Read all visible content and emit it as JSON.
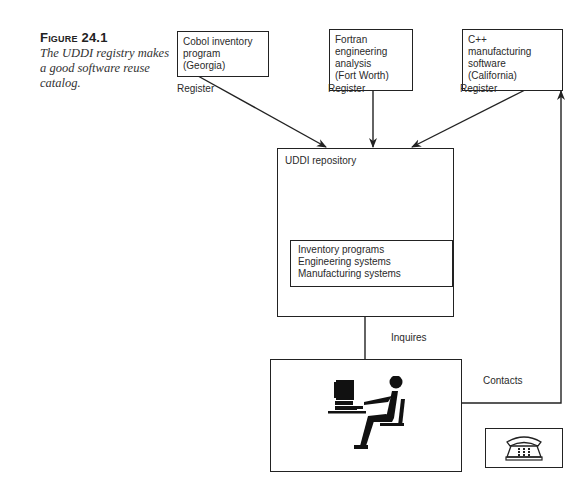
{
  "figure": {
    "label": "Figure 24.1",
    "caption": "The UDDI registry makes a good software reuse catalog."
  },
  "sources": [
    {
      "id": "cobol",
      "text": "Cobol inventory\nprogram\n(Georgia)",
      "edge_label": "Register"
    },
    {
      "id": "fortran",
      "text": "Fortran\nengineering\nanalysis\n(Fort Worth)",
      "edge_label": "Register"
    },
    {
      "id": "cpp",
      "text": "C++\nmanufacturing\nsoftware\n(California)",
      "edge_label": "Register"
    }
  ],
  "repository": {
    "title": "UDDI repository",
    "categories": [
      "Inventory programs",
      "Engineering systems",
      "Manufacturing systems"
    ]
  },
  "user": {
    "icon": "person-at-computer-icon",
    "inquire_label": "Inquires",
    "contact_label": "Contacts"
  },
  "phone": {
    "icon": "telephone-icon"
  },
  "colors": {
    "stroke": "#222222",
    "text": "#2a2a2a",
    "background": "#ffffff"
  }
}
